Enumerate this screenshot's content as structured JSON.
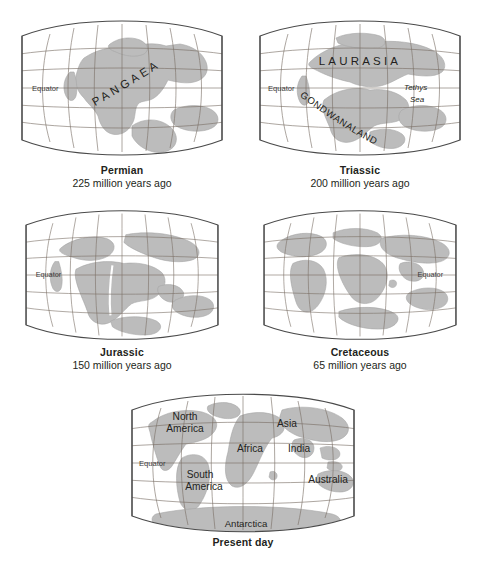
{
  "figure": {
    "colors": {
      "land": "#bcbcbc",
      "land_stroke": "#9a9a9a",
      "graticule": "#7a6f66",
      "frame": "#4a4a4a",
      "ocean": "#ffffff",
      "text": "#231f20"
    }
  },
  "panels": [
    {
      "id": "permian",
      "caption": "Permian",
      "subcaption": "225 million years ago",
      "labels": {
        "equator": "Equator",
        "landmass": "PANGAEA"
      }
    },
    {
      "id": "triassic",
      "caption": "Triassic",
      "subcaption": "200 million years ago",
      "labels": {
        "equator": "Equator",
        "northern_landmass": "LAURASIA",
        "southern_landmass": "GONDWANALAND",
        "sea_line1": "Tethys",
        "sea_line2": "Sea"
      }
    },
    {
      "id": "jurassic",
      "caption": "Jurassic",
      "subcaption": "150 million years ago",
      "labels": {
        "equator": "Equator"
      }
    },
    {
      "id": "cretaceous",
      "caption": "Cretaceous",
      "subcaption": "65 million years ago",
      "labels": {
        "equator": "Equator"
      }
    },
    {
      "id": "present-day",
      "caption": "Present day",
      "subcaption": "",
      "labels": {
        "equator": "Equator",
        "north_america_line1": "North",
        "north_america_line2": "America",
        "south_america_line1": "South",
        "south_america_line2": "America",
        "africa": "Africa",
        "asia": "Asia",
        "india": "India",
        "australia": "Australia",
        "antarctica": "Antarctica"
      }
    }
  ]
}
